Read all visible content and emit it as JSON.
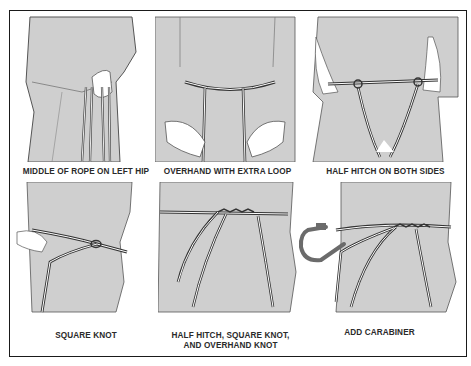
{
  "figure": {
    "panels": [
      {
        "id": 1,
        "caption": "MIDDLE OF ROPE ON LEFT HIP"
      },
      {
        "id": 2,
        "caption": "OVERHAND WITH EXTRA LOOP"
      },
      {
        "id": 3,
        "caption": "HALF HITCH ON BOTH SIDES"
      },
      {
        "id": 4,
        "caption": "SQUARE KNOT"
      },
      {
        "id": 5,
        "caption_line1": "HALF HITCH, SQUARE KNOT,",
        "caption_line2": "AND OVERHAND KNOT"
      },
      {
        "id": 6,
        "caption": "ADD CARABINER"
      }
    ],
    "colors": {
      "clothing": "#cfcfcf",
      "outline": "#555555",
      "rope_outer": "#3a3a3a",
      "rope_inner": "#ffffff",
      "hand": "#ffffff",
      "carabiner": "#6b6b6b",
      "border": "#1a1a1a"
    }
  }
}
